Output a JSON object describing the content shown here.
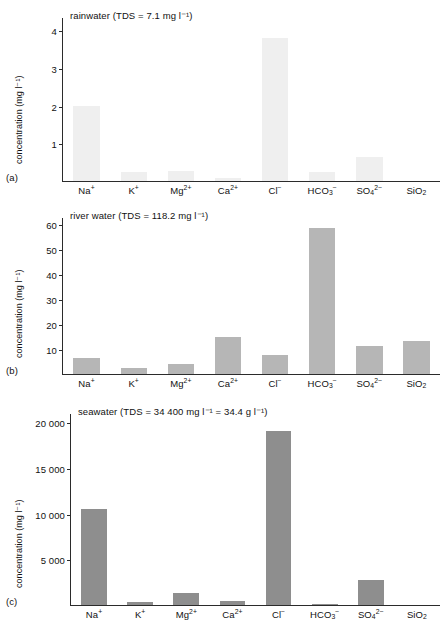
{
  "figure": {
    "ylabel": "concentration (mg l⁻¹)",
    "panel_labels": [
      "(a)",
      "(b)",
      "(c)"
    ]
  },
  "chart_data": [
    {
      "type": "bar",
      "panel": "(a)",
      "title": "rainwater (TDS = 7.1 mg l⁻¹)",
      "categories": [
        "Na⁺",
        "K⁺",
        "Mg²⁺",
        "Ca²⁺",
        "Cl⁻",
        "HCO₃⁻",
        "SO₄²⁻",
        "SiO₂"
      ],
      "values": [
        2.0,
        0.25,
        0.27,
        0.09,
        3.8,
        0.25,
        0.65,
        0.0
      ],
      "xlabel": "",
      "ylabel": "concentration (mg l⁻¹)",
      "ylim": [
        0,
        4.35
      ],
      "yticks": [
        1,
        2,
        3,
        4
      ],
      "ytick_labels": [
        "1",
        "2",
        "3",
        "4"
      ],
      "grid": false,
      "legend": "none",
      "bar_color": "#efefef"
    },
    {
      "type": "bar",
      "panel": "(b)",
      "title": "river water (TDS = 118.2 mg l⁻¹)",
      "categories": [
        "Na⁺",
        "K⁺",
        "Mg²⁺",
        "Ca²⁺",
        "Cl⁻",
        "HCO₃⁻",
        "SO₄²⁻",
        "SiO₂"
      ],
      "values": [
        6.3,
        2.3,
        4.1,
        15.0,
        7.8,
        58.4,
        11.2,
        13.1
      ],
      "xlabel": "",
      "ylabel": "concentration (mg l⁻¹)",
      "ylim": [
        0,
        63
      ],
      "yticks": [
        10,
        20,
        30,
        40,
        50,
        60
      ],
      "ytick_labels": [
        "10",
        "20",
        "30",
        "40",
        "50",
        "60"
      ],
      "grid": false,
      "legend": "none",
      "bar_color": "#b6b6b6"
    },
    {
      "type": "bar",
      "panel": "(c)",
      "title": "seawater (TDS = 34 400 mg l⁻¹ = 34.4 g l⁻¹)",
      "categories": [
        "Na⁺",
        "K⁺",
        "Mg²⁺",
        "Ca²⁺",
        "Cl⁻",
        "HCO₃⁻",
        "SO₄²⁻",
        "SiO₂"
      ],
      "values": [
        10500,
        380,
        1350,
        400,
        19000,
        142,
        2700,
        6
      ],
      "xlabel": "",
      "ylabel": "concentration (mg l⁻¹)",
      "ylim": [
        0,
        21000
      ],
      "yticks": [
        5000,
        10000,
        15000,
        20000
      ],
      "ytick_labels": [
        "5 000",
        "10 000",
        "15 000",
        "20 000"
      ],
      "grid": false,
      "legend": "none",
      "bar_color": "#8e8e8e"
    }
  ]
}
